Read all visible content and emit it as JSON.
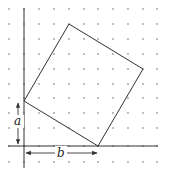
{
  "diagram": {
    "type": "dot-grid geometry",
    "grid": {
      "x_positions": [
        9,
        24,
        39,
        54,
        69,
        84,
        98,
        113,
        128,
        143,
        157
      ],
      "y_positions": [
        9,
        24,
        39,
        54,
        69,
        84,
        98,
        113,
        128,
        146,
        162
      ],
      "dot_color": "#b0b0b0"
    },
    "axes": {
      "vertical": {
        "x": 24,
        "y1": 8,
        "y2": 168
      },
      "horizontal": {
        "y": 146,
        "x1": 8,
        "x2": 158
      },
      "color": "#333333"
    },
    "square": {
      "vertices": [
        [
          69,
          24
        ],
        [
          143,
          69
        ],
        [
          98,
          146
        ],
        [
          24,
          101
        ]
      ],
      "color": "#333333"
    },
    "labels": {
      "a": "a",
      "b": "b"
    },
    "dimension_arrows": {
      "a": {
        "x": 18,
        "y1": 102,
        "y2": 144
      },
      "b": {
        "y": 153,
        "x1": 26,
        "x2": 97
      }
    }
  }
}
